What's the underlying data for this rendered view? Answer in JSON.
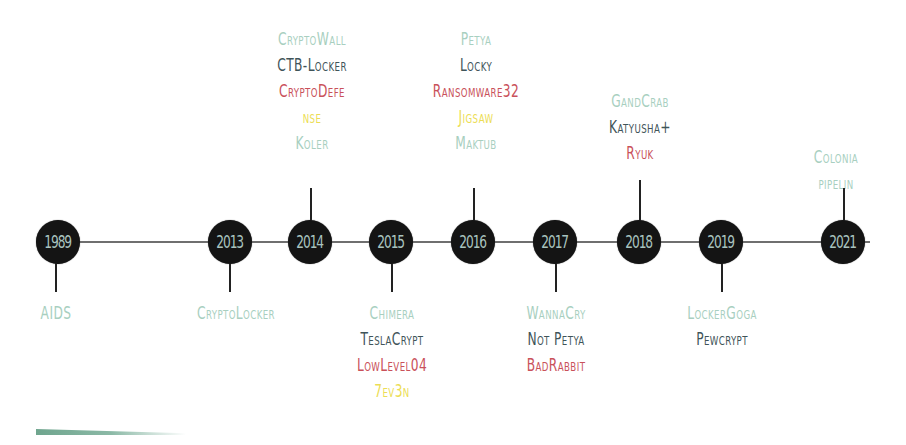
{
  "colors": {
    "mint": "#a8cfc0",
    "slate": "#3f5459",
    "red": "#c9515a",
    "yellow": "#ecdd55",
    "node": "#141414",
    "node_text": "#a9c3bf"
  },
  "years": [
    {
      "year": "1989",
      "x": 58,
      "side": "below",
      "labels": [
        {
          "text": "AIDS",
          "color": "mint"
        }
      ]
    },
    {
      "year": "2013",
      "x": 232,
      "side": "below",
      "labels": [
        {
          "text": "CryptoLocker",
          "color": "mint"
        }
      ]
    },
    {
      "year": "2014",
      "x": 310,
      "side": "above",
      "labels": [
        {
          "text": "CryptoWall",
          "color": "mint"
        },
        {
          "text": "CTB-Locker",
          "color": "slate"
        },
        {
          "text": "CryptoDefe",
          "color": "red"
        },
        {
          "text": "nse",
          "color": "yellow"
        },
        {
          "text": "Koler",
          "color": "mint"
        }
      ]
    },
    {
      "year": "2015",
      "x": 392,
      "side": "below",
      "labels": [
        {
          "text": "Chimera",
          "color": "mint"
        },
        {
          "text": "TeslaCrypt",
          "color": "slate"
        },
        {
          "text": "LowLevel04",
          "color": "red"
        },
        {
          "text": "7ev3n",
          "color": "yellow"
        }
      ]
    },
    {
      "year": "2016",
      "x": 474,
      "side": "above",
      "labels": [
        {
          "text": "Petya",
          "color": "mint"
        },
        {
          "text": "Locky",
          "color": "slate"
        },
        {
          "text": "Ransomware32",
          "color": "red"
        },
        {
          "text": "Jigsaw",
          "color": "yellow"
        },
        {
          "text": "Maktub",
          "color": "mint"
        }
      ]
    },
    {
      "year": "2017",
      "x": 556,
      "side": "below",
      "labels": [
        {
          "text": "WannaCry",
          "color": "mint"
        },
        {
          "text": "Not Petya",
          "color": "slate"
        },
        {
          "text": "BadRabbit",
          "color": "red"
        }
      ]
    },
    {
      "year": "2018",
      "x": 640,
      "side": "above",
      "labels": [
        {
          "text": "GandCrab",
          "color": "mint"
        },
        {
          "text": "Katyusha+",
          "color": "slate"
        },
        {
          "text": "Ryuk",
          "color": "red"
        }
      ]
    },
    {
      "year": "2019",
      "x": 722,
      "side": "below",
      "labels": [
        {
          "text": "LockerGoga",
          "color": "mint"
        },
        {
          "text": "Pewcrypt",
          "color": "slate"
        }
      ]
    },
    {
      "year": "2021",
      "x": 844,
      "side": "above",
      "labels": [
        {
          "text": "Colonia",
          "color": "mint"
        },
        {
          "text": "pipelin",
          "color": "mint"
        }
      ]
    }
  ]
}
